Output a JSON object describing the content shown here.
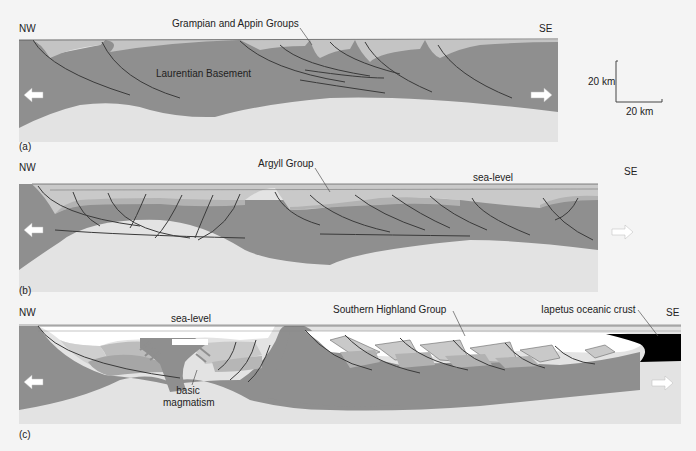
{
  "figure": {
    "panels": [
      {
        "id": "a",
        "label": "(a)",
        "left_direction": "NW",
        "right_direction": "SE",
        "annotations": [
          "Grampian and Appin Groups",
          "Laurentian Basement"
        ]
      },
      {
        "id": "b",
        "label": "(b)",
        "left_direction": "NW",
        "right_direction": "SE",
        "annotations": [
          "Argyll Group",
          "sea-level"
        ]
      },
      {
        "id": "c",
        "label": "(c)",
        "left_direction": "NW",
        "right_direction": "SE",
        "annotations": [
          "sea-level",
          "basic magmatism",
          "Southern Highland Group",
          "Iapetus oceanic crust"
        ]
      }
    ],
    "scale_bar": {
      "vertical": "20 km",
      "horizontal": "20 km"
    },
    "icons": {
      "extension_left": "arrow-left-icon",
      "extension_right": "arrow-right-icon"
    },
    "colors": {
      "background": "#f4f4f4",
      "basement": "#8f8f8f",
      "sediment_light": "#c9c9c9",
      "sediment_mid": "#b3b3b3",
      "mantle": "#e2e2e2",
      "water": "#ffffff",
      "oceanic_crust": "#000000",
      "fault_line": "#3a3a3a"
    }
  }
}
